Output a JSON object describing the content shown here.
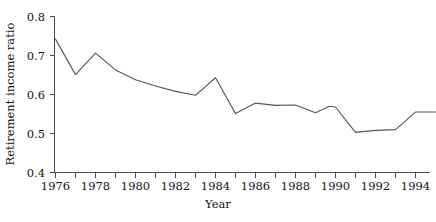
{
  "chart_data": {
    "type": "line",
    "title": "",
    "subtitle": "",
    "xlabel": "Year",
    "ylabel": "Retirement income ratio",
    "xlim": [
      1976,
      1995
    ],
    "ylim": [
      0.4,
      0.8
    ],
    "grid": false,
    "legend": false,
    "legend_position": "none",
    "line_color": "#555555",
    "x": [
      1976,
      1977,
      1978,
      1979,
      1980,
      1981,
      1982,
      1983,
      1984,
      1985,
      1986,
      1987,
      1988,
      1989,
      1990,
      1991,
      1992,
      1993,
      1994,
      1995
    ],
    "values": [
      0.742,
      0.651,
      0.706,
      0.665,
      0.641,
      0.625,
      0.611,
      0.598,
      0.643,
      0.551,
      0.575,
      0.578,
      0.565,
      0.573,
      0.575,
      0.548,
      0.563,
      0.561,
      0.502,
      0.5
    ],
    "series": [
      {
        "name": "Retirement income ratio",
        "values": [
          0.742,
          0.651,
          0.706,
          0.665,
          0.641,
          0.625,
          0.611,
          0.598,
          0.643,
          0.551,
          0.575,
          0.578,
          0.565,
          0.573,
          0.575,
          0.548,
          0.563,
          0.561,
          0.502,
          0.5
        ]
      }
    ],
    "points": [
      {
        "x": 1976.0,
        "y": 0.742
      },
      {
        "x": 1977.0,
        "y": 0.651
      },
      {
        "x": 1978.0,
        "y": 0.706
      },
      {
        "x": 1979.0,
        "y": 0.663
      },
      {
        "x": 1980.0,
        "y": 0.638
      },
      {
        "x": 1981.0,
        "y": 0.622
      },
      {
        "x": 1982.0,
        "y": 0.608
      },
      {
        "x": 1983.0,
        "y": 0.598
      },
      {
        "x": 1983.5,
        "y": 0.62
      },
      {
        "x": 1984.0,
        "y": 0.643
      },
      {
        "x": 1985.0,
        "y": 0.551
      },
      {
        "x": 1986.0,
        "y": 0.578
      },
      {
        "x": 1987.0,
        "y": 0.572
      },
      {
        "x": 1988.0,
        "y": 0.573
      },
      {
        "x": 1989.0,
        "y": 0.553
      },
      {
        "x": 1989.7,
        "y": 0.57
      },
      {
        "x": 1990.0,
        "y": 0.568
      },
      {
        "x": 1991.0,
        "y": 0.503
      },
      {
        "x": 1992.0,
        "y": 0.508
      },
      {
        "x": 1993.0,
        "y": 0.51
      },
      {
        "x": 1994.0,
        "y": 0.555
      },
      {
        "x": 1995.0,
        "y": 0.555
      }
    ],
    "xticks": [
      1976,
      1978,
      1980,
      1982,
      1984,
      1986,
      1988,
      1990,
      1992,
      1994
    ],
    "xticklabels": [
      "1976",
      "1978",
      "1980",
      "1982",
      "1984",
      "1986",
      "1988",
      "1990",
      "1992",
      "1994"
    ],
    "yticks": [
      0.4,
      0.5,
      0.6,
      0.7,
      0.8
    ],
    "yticklabels": [
      "0.4",
      "0.5",
      "0.6",
      "0.7",
      "0.8"
    ]
  },
  "axes": {
    "x_label": "Year",
    "y_label": "Retirement income ratio"
  },
  "ticks": {
    "y": [
      "0.8",
      "0.7",
      "0.6",
      "0.5",
      "0.4"
    ],
    "x": [
      "1976",
      "1978",
      "1980",
      "1982",
      "1984",
      "1986",
      "1988",
      "1990",
      "1992",
      "1994"
    ]
  }
}
